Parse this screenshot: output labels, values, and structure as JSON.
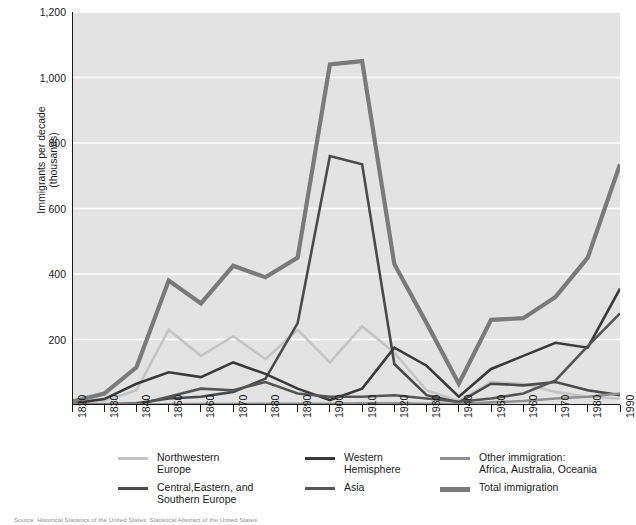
{
  "chart_data": {
    "type": "line",
    "title": "",
    "xlabel": "",
    "ylabel": "Immigrants per decade\n(thousands)",
    "xlim": [
      1820,
      1990
    ],
    "ylim": [
      0,
      1200
    ],
    "grid": true,
    "legend_position": "bottom",
    "x": [
      1820,
      1830,
      1840,
      1850,
      1860,
      1870,
      1880,
      1890,
      1900,
      1910,
      1920,
      1930,
      1940,
      1950,
      1960,
      1970,
      1980,
      1990
    ],
    "xtick_labels": [
      "1820",
      "1830",
      "1840",
      "1850",
      "1860",
      "1870",
      "1880",
      "1890",
      "1900",
      "1910",
      "1920",
      "1930",
      "1940",
      "1950",
      "1960",
      "1970",
      "1980",
      "1990"
    ],
    "ytick_labels": [
      "1,200",
      "1,000",
      "800",
      "600",
      "400",
      "200"
    ],
    "ytick_values": [
      1200,
      1000,
      800,
      600,
      400,
      200
    ],
    "series": [
      {
        "name": "Northwestern Europe",
        "color": "#c4c4c4",
        "width": 2.6,
        "values": [
          3,
          12,
          45,
          230,
          150,
          210,
          140,
          230,
          130,
          240,
          160,
          45,
          12,
          70,
          65,
          40,
          25,
          20
        ]
      },
      {
        "name": "Central,Eastern, and Southern Europe",
        "color": "#4a4a4a",
        "width": 2.6,
        "values": [
          1,
          2,
          5,
          20,
          25,
          40,
          80,
          250,
          760,
          735,
          125,
          30,
          8,
          65,
          60,
          70,
          45,
          30
        ]
      },
      {
        "name": "Western Hemisphere",
        "color": "#3a3a3a",
        "width": 2.6,
        "values": [
          5,
          18,
          65,
          100,
          85,
          130,
          95,
          50,
          15,
          50,
          175,
          120,
          25,
          110,
          150,
          190,
          175,
          355
        ]
      },
      {
        "name": "Asia",
        "color": "#555555",
        "width": 2.6,
        "values": [
          1,
          1,
          1,
          25,
          50,
          45,
          70,
          35,
          25,
          25,
          30,
          20,
          10,
          20,
          35,
          75,
          180,
          280
        ]
      },
      {
        "name": "Other immigration: Africa, Australia, Oceania",
        "color": "#909090",
        "width": 2.6,
        "values": [
          1,
          1,
          1,
          2,
          3,
          3,
          4,
          4,
          4,
          5,
          5,
          4,
          3,
          8,
          12,
          20,
          25,
          35
        ]
      },
      {
        "name": "Total immigration",
        "color": "#7a7a7a",
        "width": 4.2,
        "values": [
          10,
          35,
          115,
          380,
          310,
          425,
          390,
          450,
          1040,
          1050,
          430,
          250,
          65,
          260,
          265,
          330,
          450,
          735
        ]
      }
    ]
  },
  "axes": {
    "y_title_line1": "Immigrants per decade",
    "y_title_line2": "(thousands)"
  },
  "legend": {
    "items": [
      {
        "label": "Northwestern\nEurope",
        "color": "#c4c4c4",
        "thickness": "3px"
      },
      {
        "label": "Central,Eastern, and\nSouthern Europe",
        "color": "#4a4a4a",
        "thickness": "3px"
      },
      {
        "label": "Western\nHemisphere",
        "color": "#3a3a3a",
        "thickness": "3px"
      },
      {
        "label": "Asia",
        "color": "#555555",
        "thickness": "3px"
      },
      {
        "label": "Other immigration:\nAfrica, Australia, Oceania",
        "color": "#909090",
        "thickness": "3px"
      },
      {
        "label": "Total immigration",
        "color": "#7a7a7a",
        "thickness": "5px"
      }
    ]
  },
  "source": {
    "note": "Source:  Historical Statistics of the United States; Statistical Abstract of the United States"
  },
  "colors": {
    "plot_background": "#e3e3e3",
    "gridline": "#ffffff",
    "axis": "#1a1a1a",
    "page_background": "#ffffff"
  }
}
